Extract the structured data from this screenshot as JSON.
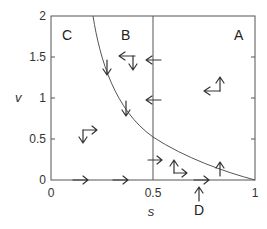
{
  "diagram": {
    "axes": {
      "x_label": "s",
      "y_label": "v",
      "x_ticks": [
        "0",
        "0.5",
        "1"
      ],
      "y_ticks": [
        "0",
        "0.5",
        "1",
        "1.5",
        "2"
      ],
      "x_range": [
        0,
        1
      ],
      "y_range": [
        0,
        2
      ]
    },
    "regions": {
      "A": "A",
      "B": "B",
      "C": "C",
      "D": "D"
    },
    "divider": {
      "s": 0.5
    },
    "curve": "decreasing boundary from (0.2, 2) to (1, 0)",
    "colors": {
      "line": "#555555",
      "text": "#333333"
    }
  }
}
